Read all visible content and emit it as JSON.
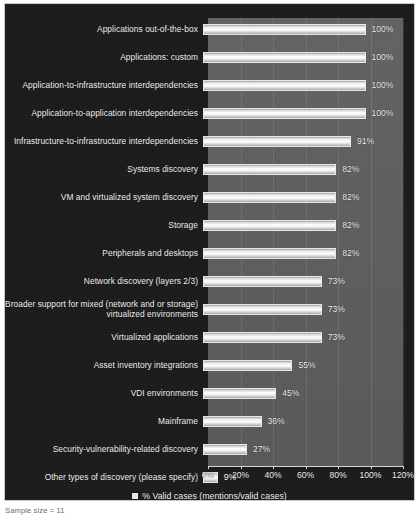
{
  "chart_data": {
    "type": "bar",
    "orientation": "horizontal",
    "title": "",
    "subtitle": "",
    "xlabel": "",
    "ylabel": "",
    "xlim": [
      0,
      120
    ],
    "grid": true,
    "legend_position": "bottom",
    "legend": [
      "% Valid cases (mentions/valid cases)"
    ],
    "categories": [
      "Applications out-of-the-box",
      "Applications: custom",
      "Application-to-infrastructure interdependencies",
      "Application-to-application interdependencies",
      "Infrastructure-to-infrastructure interdependencies",
      "Systems discovery",
      "VM and virtualized system discovery",
      "Storage",
      "Peripherals and desktops",
      "Network discovery (layers 2/3)",
      "Broader support for mixed (network and or storage) virtualized environments",
      "Virtualized applications",
      "Asset inventory integrations",
      "VDI environments",
      "Mainframe",
      "Security-vulnerability-related discovery",
      "Other types of discovery (please specify)"
    ],
    "values": [
      100,
      100,
      100,
      100,
      91,
      82,
      82,
      82,
      82,
      73,
      73,
      73,
      55,
      45,
      36,
      27,
      9
    ],
    "value_labels": [
      "100%",
      "100%",
      "100%",
      "100%",
      "91%",
      "82%",
      "82%",
      "82%",
      "82%",
      "73%",
      "73%",
      "73%",
      "55%",
      "45%",
      "36%",
      "27%",
      "9%"
    ],
    "xticks": [
      0,
      20,
      40,
      60,
      80,
      100,
      120
    ],
    "xtick_labels": [
      "0%",
      "20%",
      "40%",
      "60%",
      "80%",
      "100%",
      "120%"
    ],
    "colors": {
      "background": "#1c1c1c",
      "plot_area": "#5e5e5e",
      "bar": "#ffffff",
      "text": "#f2f2f2",
      "axis": "#d7d7d7"
    }
  },
  "rows": [
    {
      "label": "Applications out-of-the-box",
      "value_label": "100%"
    },
    {
      "label": "Applications: custom",
      "value_label": "100%"
    },
    {
      "label": "Application-to-infrastructure interdependencies",
      "value_label": "100%"
    },
    {
      "label": "Application-to-application interdependencies",
      "value_label": "100%"
    },
    {
      "label": "Infrastructure-to-infrastructure interdependencies",
      "value_label": "91%"
    },
    {
      "label": "Systems discovery",
      "value_label": "82%"
    },
    {
      "label": "VM and virtualized system discovery",
      "value_label": "82%"
    },
    {
      "label": "Storage",
      "value_label": "82%"
    },
    {
      "label": "Peripherals and desktops",
      "value_label": "82%"
    },
    {
      "label": "Network discovery (layers 2/3)",
      "value_label": "73%"
    },
    {
      "label": "Broader support for mixed (network and or storage) virtualized environments",
      "value_label": "73%"
    },
    {
      "label": "Virtualized applications",
      "value_label": "73%"
    },
    {
      "label": "Asset inventory integrations",
      "value_label": "55%"
    },
    {
      "label": "VDI environments",
      "value_label": "45%"
    },
    {
      "label": "Mainframe",
      "value_label": "36%"
    },
    {
      "label": "Security-vulnerability-related discovery",
      "value_label": "27%"
    },
    {
      "label": "Other types of discovery (please specify)",
      "value_label": "9%"
    }
  ],
  "legend": {
    "label": "% Valid cases (mentions/valid cases)"
  },
  "footnote": {
    "text": "Sample size = 11"
  }
}
